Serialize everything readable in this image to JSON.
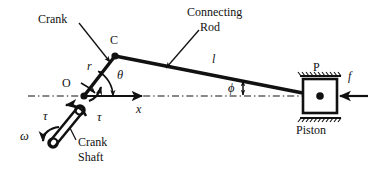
{
  "diagram": {
    "type": "engineering-schematic",
    "colors": {
      "ink": "#111111",
      "background": "#ffffff"
    },
    "labels": {
      "crank": "Crank",
      "connecting_rod_line1": "Connecting",
      "connecting_rod_line2": "Rod",
      "point_c": "C",
      "point_o": "O",
      "point_p": "P",
      "piston": "Piston",
      "crank_shaft_line1": "Crank",
      "crank_shaft_line2": "Shaft",
      "crank_radius": "r",
      "rod_length": "l",
      "theta": "θ",
      "phi": "ϕ",
      "omega": "ω",
      "tau_left": "τ",
      "tau_right": "τ",
      "x_axis": "x",
      "force": "f"
    },
    "geometry": {
      "crank_pivot_o": [
        84,
        96
      ],
      "crank_pin_c": [
        115,
        56
      ],
      "piston_center_p": [
        320,
        96
      ],
      "axis_y": 96,
      "axis_start_x": 28,
      "axis_end_x": 368,
      "piston_box": {
        "x": 303,
        "y": 79,
        "width": 34,
        "height": 34
      },
      "crank_shaft_angle_deg": 232
    },
    "annotations": [
      {
        "name": "crank-leader",
        "from": [
          78,
          22
        ],
        "to": [
          110,
          60
        ]
      },
      {
        "name": "rod-leader",
        "from": [
          197,
          30
        ],
        "to": [
          165,
          66
        ]
      },
      {
        "name": "crank-shaft-leader",
        "from": [
          78,
          133
        ],
        "to": [
          68,
          124
        ]
      }
    ]
  }
}
